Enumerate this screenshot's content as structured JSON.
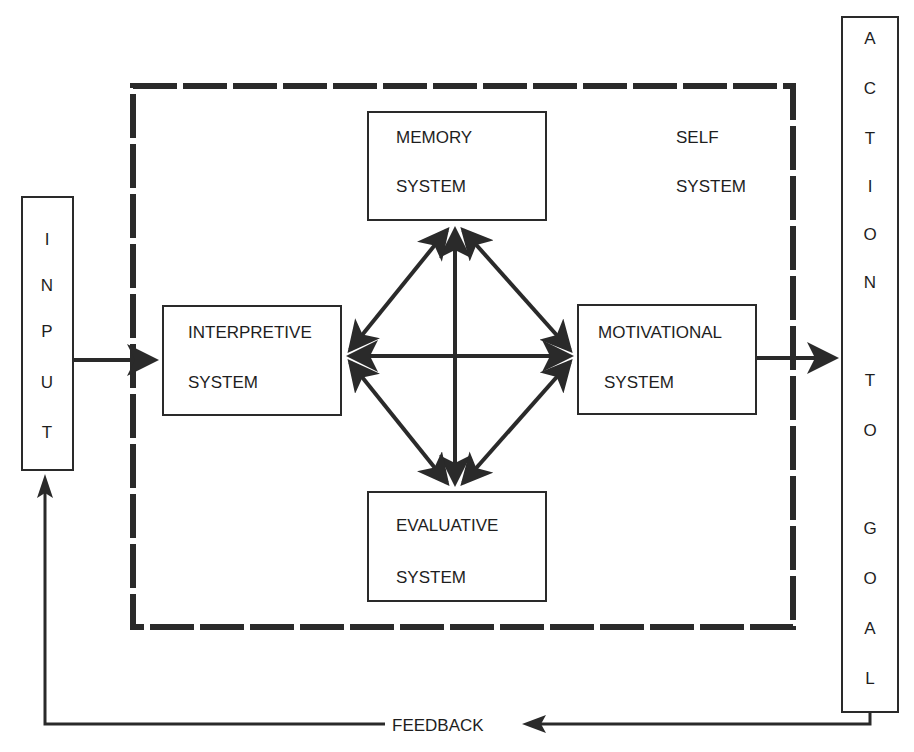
{
  "diagram": {
    "input_box": {
      "letters": [
        "I",
        "N",
        "P",
        "U",
        "T"
      ]
    },
    "action_box": {
      "letters": [
        "A",
        "C",
        "T",
        "I",
        "O",
        "N",
        "T",
        "O",
        "G",
        "O",
        "A",
        "L"
      ]
    },
    "self_system": {
      "line1": "SELF",
      "line2": "SYSTEM"
    },
    "memory": {
      "line1": "MEMORY",
      "line2": "SYSTEM"
    },
    "interpretive": {
      "line1": "INTERPRETIVE",
      "line2": "SYSTEM"
    },
    "motivational": {
      "line1": "MOTIVATIONAL",
      "line2": "SYSTEM"
    },
    "evaluative": {
      "line1": "EVALUATIVE",
      "line2": "SYSTEM"
    },
    "feedback_label": "FEEDBACK",
    "colors": {
      "ink": "#2a2a2a",
      "background": "#ffffff"
    }
  }
}
